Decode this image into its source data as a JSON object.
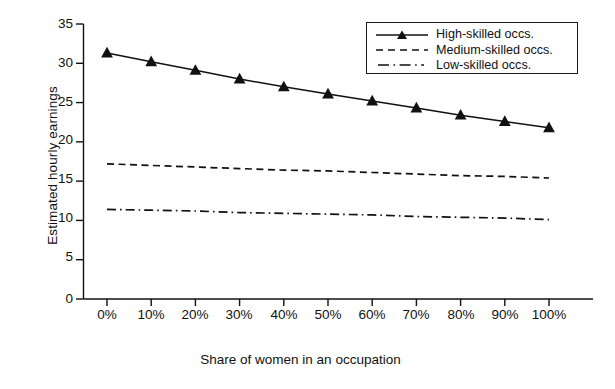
{
  "chart_data": {
    "type": "line",
    "title": "",
    "xlabel": "Share of women in an occupation",
    "ylabel": "Estimated hourly earnings",
    "categories": [
      "0%",
      "10%",
      "20%",
      "30%",
      "40%",
      "50%",
      "60%",
      "70%",
      "80%",
      "90%",
      "100%"
    ],
    "x": [
      0,
      10,
      20,
      30,
      40,
      50,
      60,
      70,
      80,
      90,
      100
    ],
    "xlim": [
      0,
      100
    ],
    "ylim": [
      0,
      35
    ],
    "yticks": [
      0,
      5,
      10,
      15,
      20,
      25,
      30,
      35
    ],
    "ytick_labels": [
      "0",
      "5",
      "10",
      "15",
      "20",
      "25",
      "30",
      "35"
    ],
    "grid": false,
    "legend_position": "top-right",
    "series": [
      {
        "name": "High-skilled occs.",
        "style": "solid",
        "marker": "triangle",
        "color": "#111111",
        "values": [
          31.3,
          30.2,
          29.1,
          28.0,
          27.0,
          26.1,
          25.2,
          24.3,
          23.4,
          22.6,
          21.8
        ]
      },
      {
        "name": "Medium-skilled occs.",
        "style": "dashed",
        "marker": "none",
        "color": "#111111",
        "values": [
          17.2,
          17.0,
          16.8,
          16.6,
          16.4,
          16.3,
          16.1,
          15.9,
          15.7,
          15.6,
          15.4
        ]
      },
      {
        "name": "Low-skilled occs.",
        "style": "dash-dot",
        "marker": "none",
        "color": "#111111",
        "values": [
          11.4,
          11.3,
          11.2,
          11.0,
          10.9,
          10.8,
          10.7,
          10.5,
          10.4,
          10.3,
          10.1
        ]
      }
    ]
  },
  "axes": {
    "y_title": "Estimated hourly earnings",
    "x_title": "Share of women in an occupation",
    "y_labels": [
      "35",
      "30",
      "25",
      "20",
      "15",
      "10",
      "5",
      "0"
    ],
    "x_labels": [
      "0%",
      "10%",
      "20%",
      "30%",
      "40%",
      "50%",
      "60%",
      "70%",
      "80%",
      "90%",
      "100%"
    ]
  },
  "legend": {
    "items": [
      {
        "label": "High-skilled occs.",
        "key": "solid-line-with-triangle-marker"
      },
      {
        "label": "Medium-skilled occs.",
        "key": "dashed-line"
      },
      {
        "label": "Low-skilled occs.",
        "key": "dash-dot-line"
      }
    ]
  },
  "colors": {
    "ink": "#111111",
    "background": "#ffffff"
  }
}
